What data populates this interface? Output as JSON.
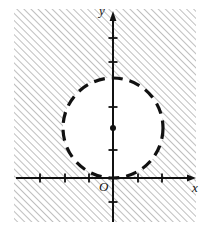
{
  "figure": {
    "type": "coordinate-plane-diagram",
    "width": 205,
    "height": 230,
    "background_color": "#ffffff",
    "ink_color": "#111111",
    "hatch_color": "#8a8a8a"
  },
  "axes": {
    "x_label": "x",
    "y_label": "y",
    "origin_label": "O",
    "origin_px": {
      "x": 113,
      "y": 178
    },
    "unit_px": 24.5,
    "x_axis": {
      "start_px": 16,
      "end_px": 196,
      "arrow": "right",
      "tick_positions_px": [
        40,
        65,
        89,
        138,
        162
      ],
      "tick_length_px": 9
    },
    "y_axis": {
      "start_px": 222,
      "end_px": 12,
      "arrow": "up",
      "tick_positions_px": [
        38,
        62,
        107,
        150,
        202
      ],
      "tick_length_px": 9
    }
  },
  "circle": {
    "center_px": {
      "x": 113,
      "y": 128
    },
    "radius_px": 50,
    "stroke": "dashed",
    "stroke_width_px": 3.2,
    "dash_pattern": "11 7",
    "fill": "#ffffff",
    "center_dot": true,
    "center_dot_radius_px": 3,
    "tangent_to": "x-axis",
    "tangent_point_px": {
      "x": 113,
      "y": 178
    }
  },
  "shading": {
    "description": "hatched region outside the circle",
    "pattern": "diagonal-lines",
    "direction": "lower-left-to-upper-right",
    "spacing_px": 5,
    "line_width_px": 1.1,
    "region_px": {
      "x": 14,
      "y": 9,
      "width": 182,
      "height": 213
    }
  }
}
